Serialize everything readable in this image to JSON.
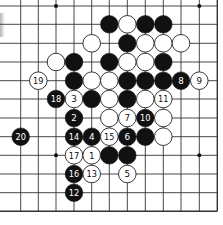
{
  "board": {
    "columns_x": [
      20.7,
      38.3,
      56,
      74,
      91.7,
      109.3,
      127.3,
      145.3,
      163.3,
      181,
      199.3,
      217.3
    ],
    "rows_y": [
      6,
      24.3,
      43.3,
      62,
      80.7,
      99,
      118,
      136.7,
      155.3,
      174,
      192.7,
      211.3
    ],
    "line_color": "#333333",
    "stone_radius": 8.8,
    "edges": {
      "right": true,
      "bottom": true,
      "top": false,
      "left": false
    },
    "star_points": [
      [
        2,
        0
      ],
      [
        10,
        0
      ],
      [
        2,
        8
      ],
      [
        10,
        8
      ]
    ]
  },
  "stones": [
    {
      "color": "black",
      "col": 5,
      "row": 1,
      "label": ""
    },
    {
      "color": "white",
      "col": 6,
      "row": 1,
      "label": ""
    },
    {
      "color": "black",
      "col": 7,
      "row": 1,
      "label": ""
    },
    {
      "color": "black",
      "col": 8,
      "row": 1,
      "label": ""
    },
    {
      "color": "white",
      "col": 4,
      "row": 2,
      "label": ""
    },
    {
      "color": "black",
      "col": 6,
      "row": 2,
      "label": ""
    },
    {
      "color": "white",
      "col": 7,
      "row": 2,
      "label": ""
    },
    {
      "color": "white",
      "col": 8,
      "row": 2,
      "label": ""
    },
    {
      "color": "white",
      "col": 9,
      "row": 2,
      "label": ""
    },
    {
      "color": "white",
      "col": 2,
      "row": 3,
      "label": ""
    },
    {
      "color": "black",
      "col": 3,
      "row": 3,
      "label": ""
    },
    {
      "color": "black",
      "col": 5,
      "row": 3,
      "label": ""
    },
    {
      "color": "white",
      "col": 6,
      "row": 3,
      "label": ""
    },
    {
      "color": "white",
      "col": 7,
      "row": 3,
      "label": ""
    },
    {
      "color": "black",
      "col": 8,
      "row": 3,
      "label": ""
    },
    {
      "color": "white",
      "col": 1,
      "row": 4,
      "label": "19"
    },
    {
      "color": "black",
      "col": 3,
      "row": 4,
      "label": ""
    },
    {
      "color": "white",
      "col": 4,
      "row": 4,
      "label": ""
    },
    {
      "color": "white",
      "col": 5,
      "row": 4,
      "label": ""
    },
    {
      "color": "black",
      "col": 6,
      "row": 4,
      "label": ""
    },
    {
      "color": "black",
      "col": 7,
      "row": 4,
      "label": ""
    },
    {
      "color": "black",
      "col": 8,
      "row": 4,
      "label": ""
    },
    {
      "color": "black",
      "col": 9,
      "row": 4,
      "label": "8"
    },
    {
      "color": "white",
      "col": 10,
      "row": 4,
      "label": "9"
    },
    {
      "color": "black",
      "col": 2,
      "row": 5,
      "label": "18"
    },
    {
      "color": "white",
      "col": 3,
      "row": 5,
      "label": "3"
    },
    {
      "color": "black",
      "col": 4,
      "row": 5,
      "label": ""
    },
    {
      "color": "white",
      "col": 5,
      "row": 5,
      "label": ""
    },
    {
      "color": "black",
      "col": 6,
      "row": 5,
      "label": ""
    },
    {
      "color": "white",
      "col": 7,
      "row": 5,
      "label": ""
    },
    {
      "color": "white",
      "col": 8,
      "row": 5,
      "label": "11"
    },
    {
      "color": "black",
      "col": 3,
      "row": 6,
      "label": "2"
    },
    {
      "color": "white",
      "col": 5,
      "row": 6,
      "label": ""
    },
    {
      "color": "white",
      "col": 6,
      "row": 6,
      "label": "7"
    },
    {
      "color": "black",
      "col": 7,
      "row": 6,
      "label": "10"
    },
    {
      "color": "white",
      "col": 8,
      "row": 6,
      "label": ""
    },
    {
      "color": "black",
      "col": 0,
      "row": 7,
      "label": "20"
    },
    {
      "color": "black",
      "col": 3,
      "row": 7,
      "label": "14"
    },
    {
      "color": "black",
      "col": 4,
      "row": 7,
      "label": "4"
    },
    {
      "color": "white",
      "col": 5,
      "row": 7,
      "label": "15"
    },
    {
      "color": "black",
      "col": 6,
      "row": 7,
      "label": "6"
    },
    {
      "color": "black",
      "col": 7,
      "row": 7,
      "label": ""
    },
    {
      "color": "white",
      "col": 8,
      "row": 7,
      "label": ""
    },
    {
      "color": "white",
      "col": 3,
      "row": 8,
      "label": "17"
    },
    {
      "color": "white",
      "col": 4,
      "row": 8,
      "label": "1"
    },
    {
      "color": "black",
      "col": 5,
      "row": 8,
      "label": ""
    },
    {
      "color": "black",
      "col": 6,
      "row": 8,
      "label": ""
    },
    {
      "color": "black",
      "col": 3,
      "row": 9,
      "label": "16"
    },
    {
      "color": "white",
      "col": 4,
      "row": 9,
      "label": "13"
    },
    {
      "color": "white",
      "col": 6,
      "row": 9,
      "label": "5"
    },
    {
      "color": "black",
      "col": 3,
      "row": 10,
      "label": "12"
    }
  ]
}
